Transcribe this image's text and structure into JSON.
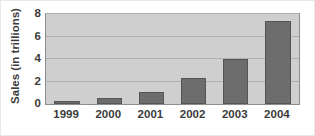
{
  "chart_data": {
    "type": "bar",
    "title": "",
    "xlabel": "",
    "ylabel": "Sales (in trillions)",
    "categories": [
      "1999",
      "2000",
      "2001",
      "2002",
      "2003",
      "2004"
    ],
    "values": [
      0.3,
      0.5,
      1.1,
      2.3,
      4.0,
      7.35
    ],
    "ylim": [
      0,
      8
    ],
    "yticks": [
      0,
      2,
      4,
      6,
      8
    ],
    "ytick_labels": [
      "0",
      "2",
      "4",
      "6",
      "8"
    ],
    "grid": true,
    "grid_axis": "y",
    "legend": false,
    "legend_position": "none",
    "series": [
      {
        "name": "Sales",
        "values": [
          0.3,
          0.5,
          1.1,
          2.3,
          4.0,
          7.35
        ]
      }
    ],
    "colors": {
      "bar_fill": "#6d6d6d",
      "bar_edge": "#555555",
      "plot_background": "#cfcfcf",
      "gridline": "#b0b0b0",
      "axis_border": "#8d8d8d",
      "text": "#3b3b3b",
      "page_background": "#ffffff"
    }
  }
}
